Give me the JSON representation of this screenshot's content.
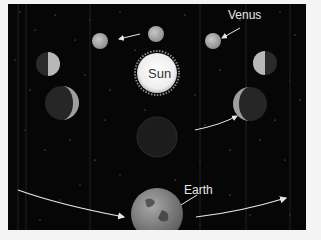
{
  "diagram": {
    "labels": {
      "sun": "Sun",
      "venus": "Venus",
      "earth": "Earth"
    },
    "colors": {
      "background": "#060606",
      "frame": "#f4f4f4",
      "sun": "#f5f5f5",
      "planet_lit": "#b8b8b8",
      "planet_dark": "#2a2a2a",
      "arrow": "#e6e6e6"
    },
    "venus_phases": [
      {
        "position": "top-left",
        "x": 100,
        "y": 41,
        "r": 8,
        "phase": "gibbous"
      },
      {
        "position": "top-center",
        "x": 156,
        "y": 34,
        "r": 8,
        "phase": "full"
      },
      {
        "position": "top-right",
        "x": 213,
        "y": 41,
        "r": 8,
        "phase": "gibbous"
      },
      {
        "position": "upper-left",
        "x": 48,
        "y": 64,
        "r": 12,
        "phase": "half"
      },
      {
        "position": "upper-right",
        "x": 265,
        "y": 63,
        "r": 12,
        "phase": "half"
      },
      {
        "position": "lower-left",
        "x": 62,
        "y": 103,
        "r": 17,
        "phase": "crescent"
      },
      {
        "position": "lower-right",
        "x": 250,
        "y": 104,
        "r": 17,
        "phase": "crescent"
      },
      {
        "position": "bottom-center",
        "x": 157,
        "y": 137,
        "r": 20,
        "phase": "new"
      }
    ],
    "sun": {
      "x": 157,
      "y": 73,
      "r": 21
    },
    "earth": {
      "x": 157,
      "y": 214,
      "r": 26
    }
  }
}
